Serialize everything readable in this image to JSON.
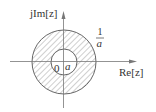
{
  "diagram": {
    "type": "complex-plane-annulus",
    "axes": {
      "y_label": "jIm[z]",
      "x_label": "Re[z]"
    },
    "origin_label": "0",
    "inner_radius_label": "a",
    "outer_radius_label": {
      "numerator": "1",
      "denominator": "a"
    },
    "region": "annulus a < |z| < 1/a (hatched)",
    "colors": {
      "stroke": "#555555",
      "hatch": "#777777",
      "text": "#333333"
    }
  }
}
